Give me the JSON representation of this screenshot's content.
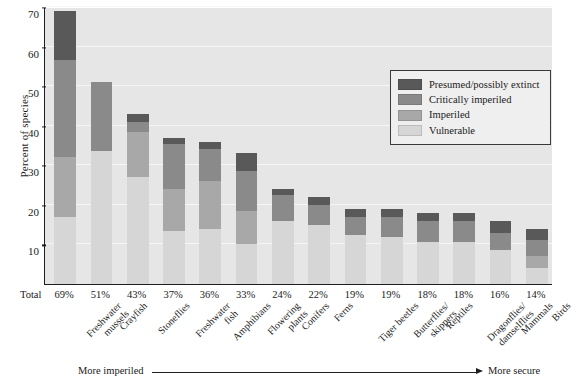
{
  "chart_data": {
    "type": "bar",
    "stacked": true,
    "title": "",
    "xlabel": "",
    "ylabel": "Percent of species",
    "ylim": [
      0,
      70
    ],
    "yticks": [
      10,
      20,
      30,
      40,
      50,
      60,
      70
    ],
    "grid": true,
    "legend_position": "top-right",
    "categories": [
      "Freshwater\nmussels",
      "Crayfish",
      "Stoneflies",
      "Freshwater\nfish",
      "Amphibians",
      "Flowering\nplants",
      "Conifers",
      "Ferns",
      "Tiger beetles",
      "Butterflies/\nskippers",
      "Reptiles",
      "Dragonflies/\ndamselflies",
      "Mammals",
      "Birds"
    ],
    "totals": [
      "69%",
      "51%",
      "43%",
      "37%",
      "36%",
      "33%",
      "24%",
      "22%",
      "19%",
      "19%",
      "18%",
      "18%",
      "16%",
      "14%"
    ],
    "total_values": [
      69,
      51,
      43,
      37,
      36,
      33,
      24,
      22,
      19,
      19,
      18,
      18,
      16,
      14
    ],
    "series": [
      {
        "name": "Vulnerable",
        "color": "#d6d6d6",
        "values": [
          17,
          33.5,
          27,
          13.5,
          14,
          10,
          16,
          15,
          12.5,
          12,
          10.5,
          10.5,
          8.5,
          4
        ]
      },
      {
        "name": "Imperiled",
        "color": "#a8a8a8",
        "values": [
          15,
          0,
          11.5,
          10.5,
          12,
          8.5,
          0,
          0,
          0,
          0,
          0,
          0,
          0,
          3
        ]
      },
      {
        "name": "Critically imperiled",
        "color": "#8a8a8a",
        "values": [
          24.5,
          17.5,
          2.5,
          11.5,
          8,
          10,
          6.5,
          5,
          4.5,
          5,
          5.5,
          5.5,
          4.5,
          4
        ]
      },
      {
        "name": "Presumed/possibly extinct",
        "color": "#595959",
        "values": [
          12.5,
          0,
          2,
          1.5,
          2,
          4.5,
          1.5,
          2,
          2,
          2,
          2,
          2,
          3,
          3
        ]
      }
    ],
    "annotations": {
      "total_row_label": "Total",
      "axis_left_note": "More imperiled",
      "axis_right_note": "More secure"
    }
  },
  "legend": {
    "items": [
      {
        "label": "Presumed/possibly extinct",
        "color": "#595959"
      },
      {
        "label": "Critically imperiled",
        "color": "#8a8a8a"
      },
      {
        "label": "Imperiled",
        "color": "#a8a8a8"
      },
      {
        "label": "Vulnerable",
        "color": "#d6d6d6"
      }
    ]
  }
}
